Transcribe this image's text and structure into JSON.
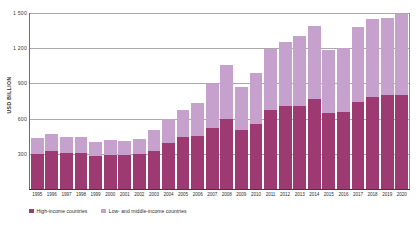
{
  "chart_data": {
    "type": "bar",
    "stacked": true,
    "title": "",
    "subtitle": "",
    "xlabel": "",
    "ylabel": "USD BILLION",
    "ylim": [
      0,
      1500
    ],
    "yticks": [
      "1 500",
      "1 200",
      "900",
      "600",
      "300"
    ],
    "ytick_values": [
      1500,
      1200,
      900,
      600,
      300
    ],
    "grid": true,
    "legend_position": "bottom-left",
    "categories": [
      "1995",
      "1996",
      "1997",
      "1998",
      "1999",
      "2000",
      "2001",
      "2002",
      "2003",
      "2004",
      "2005",
      "2006",
      "2007",
      "2008",
      "2009",
      "2010",
      "2011",
      "2012",
      "2013",
      "2014",
      "2015",
      "2016",
      "2017",
      "2018",
      "2019",
      "2020"
    ],
    "series": [
      {
        "name": "High-income countries",
        "color": "#9e3a72",
        "values": [
          300,
          320,
          305,
          310,
          285,
          290,
          288,
          300,
          325,
          390,
          445,
          455,
          520,
          595,
          500,
          555,
          670,
          705,
          710,
          770,
          650,
          660,
          745,
          780,
          800,
          805
        ]
      },
      {
        "name": "Low- and middle-income countries",
        "color": "#c7a1cd",
        "values": [
          135,
          150,
          140,
          135,
          115,
          125,
          125,
          130,
          175,
          205,
          225,
          275,
          375,
          460,
          370,
          430,
          520,
          545,
          590,
          620,
          535,
          545,
          640,
          665,
          660,
          685
        ]
      }
    ],
    "totals": [
      435,
      470,
      445,
      445,
      400,
      415,
      413,
      430,
      500,
      595,
      670,
      730,
      895,
      1055,
      870,
      985,
      1190,
      1250,
      1300,
      1390,
      1185,
      1205,
      1385,
      1445,
      1460,
      1490
    ]
  },
  "legend": {
    "items": [
      {
        "label": "High-income countries"
      },
      {
        "label": "Low- and middle-income countries"
      }
    ]
  }
}
